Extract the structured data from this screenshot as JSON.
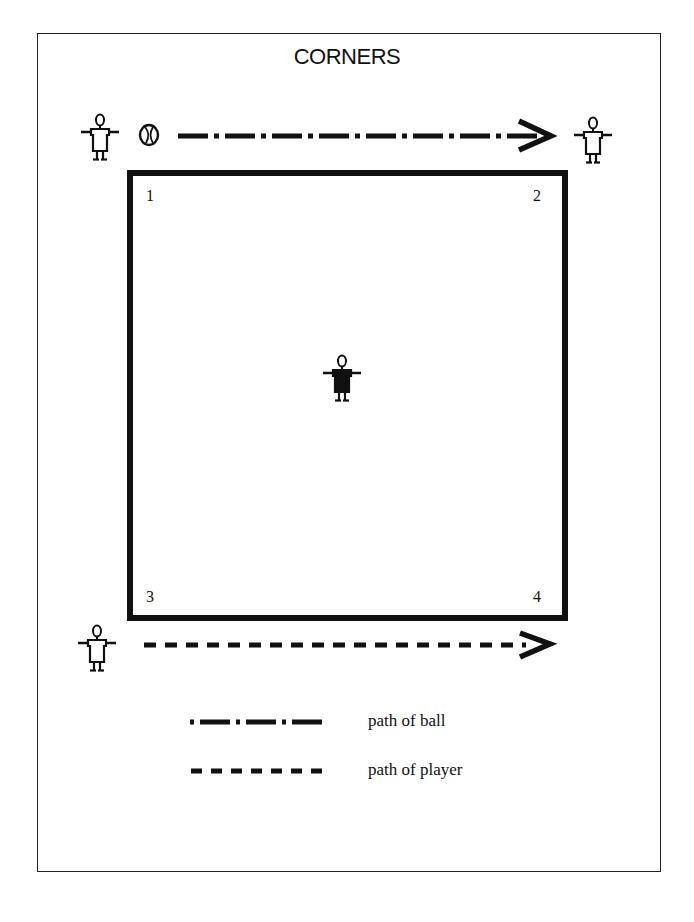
{
  "diagram": {
    "title": "CORNERS",
    "field": {
      "shape": "square",
      "corners": [
        {
          "label": "1",
          "position": "top-left"
        },
        {
          "label": "2",
          "position": "top-right"
        },
        {
          "label": "3",
          "position": "bottom-left"
        },
        {
          "label": "4",
          "position": "bottom-right"
        }
      ]
    },
    "players": [
      {
        "id": "top-left-player",
        "style": "outline",
        "has_ball": true
      },
      {
        "id": "top-right-player",
        "style": "outline",
        "has_ball": false
      },
      {
        "id": "center-player",
        "style": "filled",
        "has_ball": false
      },
      {
        "id": "bottom-left-player",
        "style": "outline",
        "has_ball": false
      }
    ],
    "paths": [
      {
        "type": "ball",
        "line_style": "dash-dot",
        "from": "top-left-player",
        "to": "top-right-player"
      },
      {
        "type": "player",
        "line_style": "dashed",
        "from": "bottom-left-player",
        "direction": "right"
      }
    ]
  },
  "legend": {
    "items": [
      {
        "line_style": "dash-dot",
        "label": "path of ball"
      },
      {
        "line_style": "dashed",
        "label": "path of player"
      }
    ]
  },
  "colors": {
    "ink": "#111111",
    "paper": "#ffffff"
  },
  "page": {
    "number": ""
  }
}
